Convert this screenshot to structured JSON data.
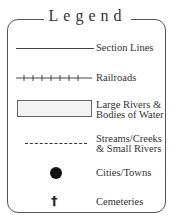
{
  "legend": {
    "title": "Legend",
    "items": [
      {
        "symbol": "solid-line",
        "label": "Section Lines"
      },
      {
        "symbol": "railroad-line",
        "label": "Railroads"
      },
      {
        "symbol": "shaded-rectangle",
        "label_line1": "Large Rivers &",
        "label_line2": "Bodies of Water"
      },
      {
        "symbol": "dashed-line",
        "label_line1": "Streams/Creeks",
        "label_line2": "& Small Rivers"
      },
      {
        "symbol": "filled-circle",
        "label": "Cities/Towns"
      },
      {
        "symbol": "cemetery-cross",
        "label": "Cemeteries",
        "glyph": "†"
      }
    ]
  },
  "colors": {
    "line": "#444444",
    "frame": "#555555",
    "water_fill": "#f4f4f4",
    "dot": "#111111"
  }
}
